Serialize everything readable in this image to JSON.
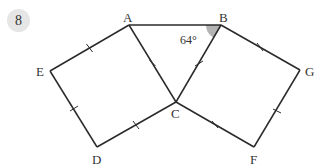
{
  "question_number": "8",
  "diagram": {
    "points": {
      "A": {
        "label": "A",
        "x": 129,
        "y": 25
      },
      "B": {
        "label": "B",
        "x": 221,
        "y": 25
      },
      "C": {
        "label": "C",
        "x": 176,
        "y": 102
      },
      "D": {
        "label": "D",
        "x": 97,
        "y": 147
      },
      "E": {
        "label": "E",
        "x": 50,
        "y": 71
      },
      "F": {
        "label": "F",
        "x": 254,
        "y": 147
      },
      "G": {
        "label": "G",
        "x": 300,
        "y": 70
      }
    },
    "angle": {
      "vertex": "B",
      "label": "64°",
      "fill": "#b3b3b3"
    },
    "line_color": "#2a2a2a",
    "badge_color": "#e6e6e6"
  }
}
